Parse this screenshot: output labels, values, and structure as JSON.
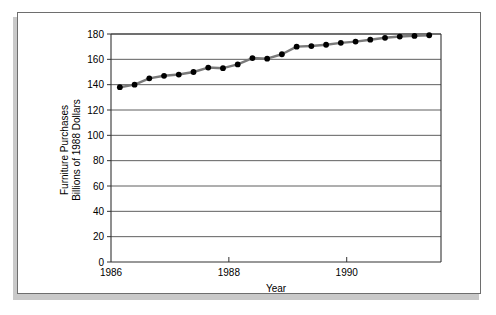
{
  "figure": {
    "name": "furniture-purchases-line-chart",
    "background": "#ffffff",
    "frame_color": "#6e6e6e",
    "shadow_color": "#c9c9c9"
  },
  "chart_data": {
    "type": "line",
    "title": "",
    "xlabel": "Year",
    "ylabel": "Furniture Purchases Billions of 1988 Dollars",
    "ylabel_lines": [
      "Furniture Purchases",
      "Billions of 1988 Dollars"
    ],
    "xlim": [
      1986.0,
      1991.6
    ],
    "ylim": [
      0,
      180
    ],
    "grid": true,
    "grid_axis": "y",
    "legend": false,
    "legend_position": "none",
    "line_color": "#7a7a7a",
    "marker_color": "#000000",
    "marker": "circle",
    "xticks": [
      1986,
      1988,
      1990
    ],
    "xtick_labels": [
      "1986",
      "1988",
      "1990"
    ],
    "yticks": [
      0,
      20,
      40,
      60,
      80,
      100,
      120,
      140,
      160,
      180
    ],
    "ytick_labels": [
      "0",
      "20",
      "40",
      "60",
      "80",
      "100",
      "120",
      "140",
      "160",
      "180"
    ],
    "x": [
      1986.15,
      1986.4,
      1986.65,
      1986.9,
      1987.15,
      1987.4,
      1987.65,
      1987.9,
      1988.15,
      1988.4,
      1988.65,
      1988.9,
      1989.15,
      1989.4,
      1989.65,
      1989.9,
      1990.15,
      1990.4,
      1990.65,
      1990.9,
      1991.15,
      1991.4
    ],
    "values": [
      138,
      140,
      145,
      147,
      148,
      150,
      153.5,
      153,
      156,
      161,
      160.5,
      164,
      170,
      170.5,
      171.5,
      173,
      174,
      175.5,
      177,
      178,
      178.5,
      179
    ],
    "series": [
      {
        "name": "Furniture Purchases",
        "values": [
          138,
          140,
          145,
          147,
          148,
          150,
          153.5,
          153,
          156,
          161,
          160.5,
          164,
          170,
          170.5,
          171.5,
          173,
          174,
          175.5,
          177,
          178,
          178.5,
          179
        ]
      }
    ]
  }
}
